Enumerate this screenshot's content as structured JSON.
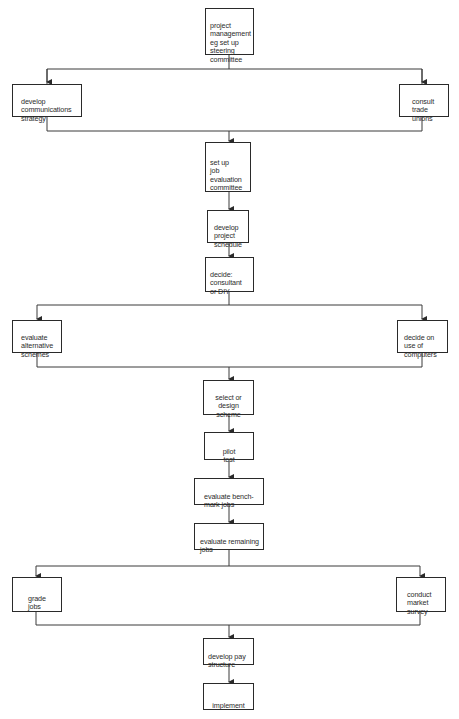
{
  "diagram": {
    "type": "flowchart",
    "line_color": "#3a3a3a",
    "nodes": [
      {
        "id": "n1",
        "label": "project\nmanagement\neg set up\nsteering\ncommittee"
      },
      {
        "id": "n2",
        "label": "develop\ncommunications\nstrategy"
      },
      {
        "id": "n3",
        "label": "consult\ntrade\nunions"
      },
      {
        "id": "n4",
        "label": "set up\njob\nevaluation\ncommittee"
      },
      {
        "id": "n5",
        "label": "develop\nproject\nschedule"
      },
      {
        "id": "n6",
        "label": "decide:\nconsultant\nor DIY"
      },
      {
        "id": "n7",
        "label": "evaluate\nalternative\nschemes"
      },
      {
        "id": "n8",
        "label": "decide on\nuse of\ncomputers"
      },
      {
        "id": "n9",
        "label": "select or\ndesign\nscheme"
      },
      {
        "id": "n10",
        "label": "pilot\ntest"
      },
      {
        "id": "n11",
        "label": "evaluate bench-\nmark jobs"
      },
      {
        "id": "n12",
        "label": "evaluate remaining\njobs"
      },
      {
        "id": "n13",
        "label": "grade\njobs"
      },
      {
        "id": "n14",
        "label": "conduct\nmarket\nsurvey"
      },
      {
        "id": "n15",
        "label": "develop pay\nstructure"
      },
      {
        "id": "n16",
        "label": "implement"
      }
    ],
    "edges": [
      {
        "from": "n1",
        "to": "n2"
      },
      {
        "from": "n1",
        "to": "n3"
      },
      {
        "from": "n2",
        "to": "n4"
      },
      {
        "from": "n3",
        "to": "n4"
      },
      {
        "from": "n4",
        "to": "n5"
      },
      {
        "from": "n5",
        "to": "n6"
      },
      {
        "from": "n6",
        "to": "n7"
      },
      {
        "from": "n6",
        "to": "n8"
      },
      {
        "from": "n7",
        "to": "n9"
      },
      {
        "from": "n8",
        "to": "n9"
      },
      {
        "from": "n9",
        "to": "n10"
      },
      {
        "from": "n10",
        "to": "n11"
      },
      {
        "from": "n11",
        "to": "n12"
      },
      {
        "from": "n12",
        "to": "n13"
      },
      {
        "from": "n12",
        "to": "n14"
      },
      {
        "from": "n13",
        "to": "n15"
      },
      {
        "from": "n14",
        "to": "n15"
      },
      {
        "from": "n15",
        "to": "n16"
      }
    ]
  }
}
